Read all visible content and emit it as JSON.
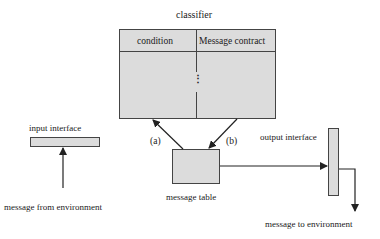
{
  "diagram": {
    "classifier": {
      "title": "classifier",
      "columns": [
        "condition",
        "Message contract"
      ],
      "ellipsis": "⋮"
    },
    "input_interface": {
      "label": "input interface"
    },
    "message_from_environment": {
      "label": "message from environment"
    },
    "message_table": {
      "label": "message table"
    },
    "output_interface": {
      "label": "output interface"
    },
    "message_to_environment": {
      "label": "message to environment"
    },
    "arrows": {
      "a": {
        "label": "(a)",
        "from": "message table",
        "to": "classifier"
      },
      "b": {
        "label": "(b)",
        "from": "classifier",
        "to": "message table"
      },
      "env_in": {
        "from": "message from environment",
        "to": "input interface"
      },
      "table_to_output": {
        "from": "message table",
        "to": "output interface"
      },
      "output_to_env": {
        "from": "output interface",
        "to": "message to environment"
      }
    },
    "colors": {
      "box_fill": "#dcdcdc",
      "line": "#333333",
      "text": "#1a1a1a"
    }
  }
}
